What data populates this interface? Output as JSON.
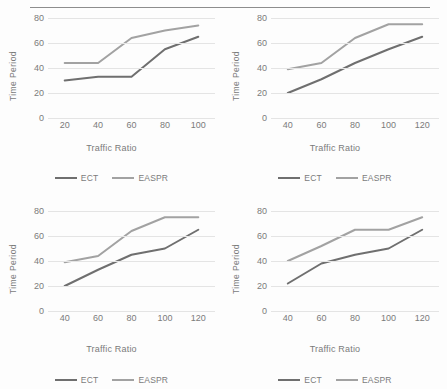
{
  "page": {
    "background": "#ffffff",
    "rule_color": "#8d8d8d"
  },
  "colors": {
    "ect": "#6f6f6f",
    "easpr": "#a2a2a2",
    "gridline": "#e4e4e4",
    "text": "#7b7b7b"
  },
  "legend": {
    "ect_label": "ECT",
    "easpr_label": "EASPR"
  },
  "chart_data": [
    {
      "id": "chart-top-left",
      "type": "line",
      "title": "",
      "xlabel": "Traffic Ratio",
      "ylabel": "Time Period",
      "x": [
        20,
        40,
        60,
        80,
        100
      ],
      "xticks": [
        "20",
        "40",
        "60",
        "80",
        "100"
      ],
      "yticks": [
        "0",
        "20",
        "40",
        "60",
        "80"
      ],
      "ylim": [
        0,
        80
      ],
      "xlim": [
        10,
        110
      ],
      "grid": true,
      "legend_position": "bottom",
      "series": [
        {
          "name": "ECT",
          "values": [
            30,
            33,
            33,
            55,
            65
          ],
          "color": "#6f6f6f"
        },
        {
          "name": "EASPR",
          "values": [
            44,
            44,
            64,
            70,
            74
          ],
          "color": "#a2a2a2"
        }
      ]
    },
    {
      "id": "chart-top-right",
      "type": "line",
      "title": "",
      "xlabel": "Traffic Ratio",
      "ylabel": "Time Period",
      "x": [
        40,
        60,
        80,
        100,
        120
      ],
      "xticks": [
        "40",
        "60",
        "80",
        "100",
        "120"
      ],
      "yticks": [
        "0",
        "20",
        "40",
        "60",
        "80"
      ],
      "ylim": [
        0,
        80
      ],
      "xlim": [
        30,
        130
      ],
      "grid": true,
      "legend_position": "bottom",
      "series": [
        {
          "name": "ECT",
          "values": [
            20,
            31,
            44,
            55,
            65
          ],
          "color": "#6f6f6f"
        },
        {
          "name": "EASPR",
          "values": [
            39,
            44,
            64,
            75,
            75
          ],
          "color": "#a2a2a2"
        }
      ]
    },
    {
      "id": "chart-bottom-left",
      "type": "line",
      "title": "",
      "xlabel": "Traffic Ratio",
      "ylabel": "Time Period",
      "x": [
        40,
        60,
        80,
        100,
        120
      ],
      "xticks": [
        "40",
        "60",
        "80",
        "100",
        "120"
      ],
      "yticks": [
        "0",
        "20",
        "40",
        "60",
        "80"
      ],
      "ylim": [
        0,
        80
      ],
      "xlim": [
        30,
        130
      ],
      "grid": true,
      "legend_position": "bottom",
      "series": [
        {
          "name": "ECT",
          "values": [
            20,
            33,
            45,
            50,
            65
          ],
          "color": "#6f6f6f"
        },
        {
          "name": "EASPR",
          "values": [
            39,
            44,
            64,
            75,
            75
          ],
          "color": "#a2a2a2"
        }
      ]
    },
    {
      "id": "chart-bottom-right",
      "type": "line",
      "title": "",
      "xlabel": "Traffic Ratio",
      "ylabel": "Time Period",
      "x": [
        40,
        60,
        80,
        100,
        120
      ],
      "xticks": [
        "40",
        "60",
        "80",
        "100",
        "120"
      ],
      "yticks": [
        "0",
        "20",
        "40",
        "60",
        "80"
      ],
      "ylim": [
        0,
        80
      ],
      "xlim": [
        30,
        130
      ],
      "grid": true,
      "legend_position": "bottom",
      "series": [
        {
          "name": "ECT",
          "values": [
            22,
            38,
            45,
            50,
            65
          ],
          "color": "#6f6f6f"
        },
        {
          "name": "EASPR",
          "values": [
            40,
            52,
            65,
            65,
            75
          ],
          "color": "#a2a2a2"
        }
      ]
    }
  ]
}
